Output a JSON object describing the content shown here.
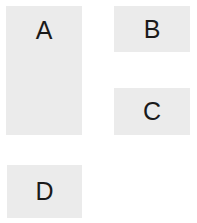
{
  "diagram": {
    "title": "",
    "background_color": "#ffffff",
    "panel_fill_color": "#ebebeb",
    "label_color": "#1a1a1a",
    "panels": [
      {
        "id": "a",
        "label": "A",
        "x": 6,
        "y": 6,
        "width": 76,
        "height": 129
      },
      {
        "id": "b",
        "label": "B",
        "x": 114,
        "y": 6,
        "width": 76,
        "height": 46
      },
      {
        "id": "c",
        "label": "C",
        "x": 114,
        "y": 88,
        "width": 76,
        "height": 47
      },
      {
        "id": "d",
        "label": "D",
        "x": 7,
        "y": 165,
        "width": 75,
        "height": 53
      }
    ]
  }
}
